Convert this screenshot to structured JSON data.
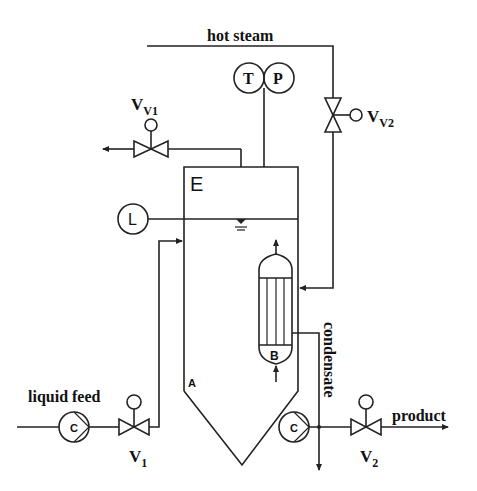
{
  "diagram": {
    "type": "process-flow-diagram",
    "streams": {
      "hot_steam": "hot steam",
      "liquid_feed": "liquid feed",
      "product": "product",
      "condensate": "condensate"
    },
    "valves": {
      "vv1": {
        "main": "V",
        "sub": "V1"
      },
      "vv2": {
        "main": "V",
        "sub": "V2"
      },
      "v1": {
        "main": "V",
        "sub": "1"
      },
      "v2": {
        "main": "V",
        "sub": "2"
      }
    },
    "instruments": {
      "temperature": "T",
      "pressure": "P",
      "level": "L"
    },
    "equipment": {
      "evaporator_label": "E",
      "vessel_label": "A",
      "heat_exchanger_label": "B",
      "feed_pump_label": "C",
      "product_pump_label": "C"
    }
  }
}
